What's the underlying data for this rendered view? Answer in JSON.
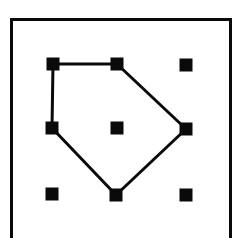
{
  "diagram": {
    "type": "dot-grid-polygon",
    "grid": {
      "rows": 3,
      "cols": 3
    },
    "colors": {
      "ink": "#0a0a0a",
      "background": "#ffffff"
    },
    "dot_size": 13,
    "dots": [
      {
        "id": "r1c1",
        "x": 53,
        "y": 64
      },
      {
        "id": "r1c2",
        "x": 117,
        "y": 64
      },
      {
        "id": "r1c3",
        "x": 186,
        "y": 65
      },
      {
        "id": "r2c1",
        "x": 52,
        "y": 128
      },
      {
        "id": "r2c2",
        "x": 117,
        "y": 128
      },
      {
        "id": "r2c3",
        "x": 186,
        "y": 129
      },
      {
        "id": "r3c1",
        "x": 52,
        "y": 194
      },
      {
        "id": "r3c2",
        "x": 116,
        "y": 195
      },
      {
        "id": "r3c3",
        "x": 186,
        "y": 195
      }
    ],
    "polygon": {
      "vertices": [
        "r1c1",
        "r1c2",
        "r2c3",
        "r3c2",
        "r2c1"
      ],
      "closed": true,
      "stroke_width": 3
    }
  }
}
